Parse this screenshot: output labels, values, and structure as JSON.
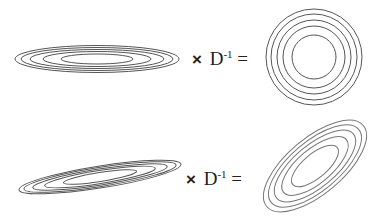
{
  "diagram": {
    "rows": [
      {
        "label": "row-top",
        "input_shape": "axis-aligned elongated ellipses",
        "operator": {
          "times": "×",
          "symbol": "D",
          "exponent": "-1",
          "equals": "="
        },
        "output_shape": "concentric circles"
      },
      {
        "label": "row-bottom",
        "input_shape": "tilted elongated ellipses",
        "operator": {
          "times": "×",
          "symbol": "D",
          "exponent": "-1",
          "equals": "="
        },
        "output_shape": "tilted ellipses"
      }
    ],
    "stroke_color": "#555555",
    "contour_count": 5
  }
}
